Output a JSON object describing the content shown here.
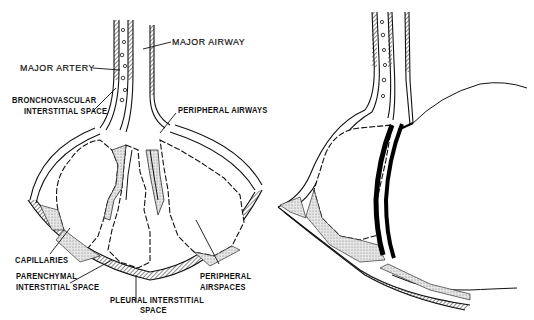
{
  "figure": {
    "panels": [
      {
        "id": "normal",
        "description": "Normal lung unit: airway, artery, interstitial spaces and airspaces"
      },
      {
        "id": "abnormal",
        "description": "Lung unit with adjacent large rounded lesion compressing the airspaces; thickened black boundary"
      }
    ],
    "labels": {
      "major_airway": "MAJOR AIRWAY",
      "major_artery": "MAJOR ARTERY",
      "bronchovascular_1": "BRONCHOVASCULAR",
      "bronchovascular_2": "INTERSTITIAL SPACE",
      "peripheral_airways": "PERIPHERAL AIRWAYS",
      "capillaries": "CAPILLARIES",
      "parenchymal_1": "PARENCHYMAL",
      "parenchymal_2": "INTERSTITIAL SPACE",
      "pleural_1": "PLEURAL INTERSTITIAL",
      "pleural_2": "SPACE",
      "peripheral_airspaces_1": "PERIPHERAL",
      "peripheral_airspaces_2": "AIRSPACES"
    },
    "colors": {
      "ink": "#111111",
      "stipple": "#d8d8d8",
      "background": "#ffffff"
    }
  }
}
